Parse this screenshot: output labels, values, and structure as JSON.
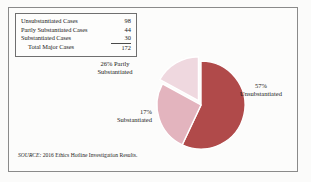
{
  "figure": {
    "background_color": "#fbfbfa",
    "frame_color": "#8a8a8a"
  },
  "table": {
    "rows": [
      {
        "label": "Unsubstantiated Cases",
        "value": "98"
      },
      {
        "label": "Partly Substantiated Cases",
        "value": "44"
      },
      {
        "label": "Substantiated Cases",
        "value": "30"
      }
    ],
    "total": {
      "label": "Total Major Cases",
      "value": "172"
    }
  },
  "labels": {
    "partly": {
      "pct": "26% Partly",
      "name": "Substantiated"
    },
    "substantiated": {
      "pct": "17%",
      "name": "Substantiated"
    },
    "unsubstantiated": {
      "pct": "57%",
      "name": "Unsubstantiated"
    }
  },
  "source": {
    "prefix": "SOURCE:",
    "text": " 2016 Ethics Hotline Investigation Results."
  },
  "chart_data": {
    "type": "pie",
    "title": "",
    "categories": [
      "Unsubstantiated",
      "Partly Substantiated",
      "Substantiated"
    ],
    "values": [
      57,
      26,
      17
    ],
    "counts": [
      98,
      44,
      30
    ],
    "total_count": 172,
    "value_unit": "percent",
    "data_labels": [
      "57% Unsubstantiated",
      "26% Partly Substantiated",
      "17% Substantiated"
    ],
    "colors": [
      "#b04a4a",
      "#e3b4be",
      "#efd8df"
    ],
    "edge_color": "#ffffff",
    "start_angle_deg": 0,
    "direction": "clockwise",
    "exploded_slices": [
      "Substantiated"
    ],
    "legend": "none",
    "grid": false
  }
}
